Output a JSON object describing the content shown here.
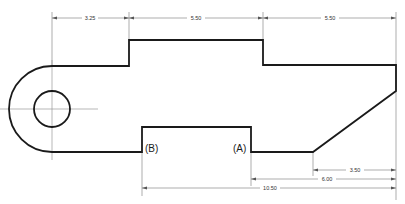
{
  "drawing": {
    "type": "mechanical-part-outline",
    "dimensions": {
      "top": [
        {
          "id": "dim-left-to-step",
          "value": "3.25"
        },
        {
          "id": "dim-top-width",
          "value": "5.50"
        },
        {
          "id": "dim-right-section",
          "value": "5.50"
        }
      ],
      "bottom": [
        {
          "id": "dim-chamfer",
          "value": "3.50"
        },
        {
          "id": "dim-from-a",
          "value": "6.00"
        },
        {
          "id": "dim-from-b",
          "value": "10.50"
        }
      ]
    },
    "labels": {
      "point_b": "(B)",
      "point_a": "(A)"
    },
    "features": {
      "hole": "circular hole with center lines",
      "rounded_end": "semicircular left end",
      "chamfer": "angled lower-right corner"
    },
    "colors": {
      "outline": "#1a1a1a",
      "dimension": "#8a8a8a",
      "background": "#ffffff"
    }
  }
}
